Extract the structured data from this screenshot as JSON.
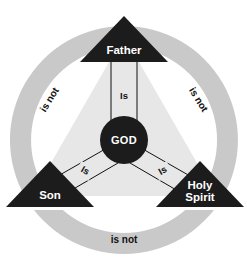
{
  "diagram": {
    "canvas": {
      "width": 247,
      "height": 263
    },
    "colors": {
      "background": "#ffffff",
      "ring": "#c9c9c9",
      "inner_triangle": "#e7e7e7",
      "node_fill": "#1c1c1c",
      "center_fill": "#1c1c1c",
      "label_light": "#ffffff",
      "label_dark": "#111111",
      "line": "#111111"
    },
    "center": {
      "label": "GOD",
      "cx": 124,
      "cy": 140,
      "r": 24
    },
    "nodes": [
      {
        "id": "father",
        "label": "Father",
        "lines": [
          "Father"
        ],
        "position": "top",
        "cx": 124,
        "cy": 47
      },
      {
        "id": "son",
        "label": "Son",
        "lines": [
          "Son"
        ],
        "position": "bottom-left",
        "cx": 50,
        "cy": 193
      },
      {
        "id": "holy-spirit",
        "label": "Holy Spirit",
        "lines": [
          "Holy",
          "Spirit"
        ],
        "position": "bottom-right",
        "cx": 200,
        "cy": 193
      }
    ],
    "spokes": [
      {
        "id": "god-father",
        "label": "Is",
        "from": "center",
        "to": "father"
      },
      {
        "id": "god-son",
        "label": "Is",
        "from": "center",
        "to": "son"
      },
      {
        "id": "god-holy-spirit",
        "label": "Is",
        "from": "center",
        "to": "holy-spirit"
      }
    ],
    "arcs": [
      {
        "id": "father-son",
        "label": "is not",
        "side": "left",
        "rotation": -62
      },
      {
        "id": "father-holy-spirit",
        "label": "is not",
        "side": "right",
        "rotation": 62
      },
      {
        "id": "son-holy-spirit",
        "label": "is not",
        "side": "bottom",
        "rotation": 0
      }
    ]
  }
}
